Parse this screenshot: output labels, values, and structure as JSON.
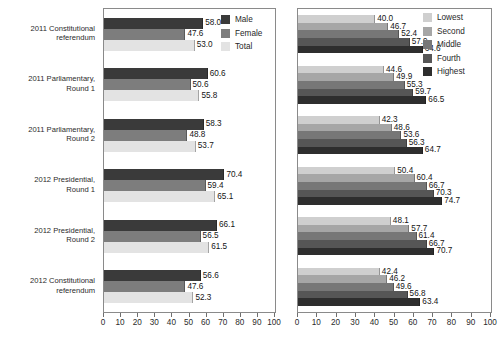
{
  "chart_data": [
    {
      "id": "by-sex",
      "type": "bar",
      "orientation": "horizontal",
      "title": "",
      "xlabel": "",
      "ylabel": "",
      "xlim": [
        0,
        100
      ],
      "xticks": [
        0,
        10,
        20,
        30,
        40,
        50,
        60,
        70,
        80,
        90,
        100
      ],
      "grid": false,
      "legend_position": "top-right",
      "categories": [
        "2011 Constitutional\nreferendum",
        "2011 Parliamentary,\nRound 1",
        "2011 Parliamentary,\nRound 2",
        "2012 Presidential,\nRound 1",
        "2012 Presidential,\nRound 2",
        "2012 Constitutional\nreferendum"
      ],
      "series": [
        {
          "name": "Male",
          "color": "#3a3a3a",
          "values": [
            58.0,
            60.6,
            58.3,
            70.4,
            66.1,
            56.6
          ]
        },
        {
          "name": "Female",
          "color": "#7d7d7d",
          "values": [
            47.6,
            50.6,
            48.8,
            59.4,
            56.5,
            47.6
          ]
        },
        {
          "name": "Total",
          "color": "#e3e3e3",
          "values": [
            53.0,
            55.8,
            53.7,
            65.1,
            61.5,
            52.3
          ]
        }
      ]
    },
    {
      "id": "by-wealth-quintile",
      "type": "bar",
      "orientation": "horizontal",
      "title": "",
      "xlabel": "",
      "ylabel": "",
      "xlim": [
        0,
        100
      ],
      "xticks": [
        0,
        10,
        20,
        30,
        40,
        50,
        60,
        70,
        80,
        90,
        100
      ],
      "grid": false,
      "legend_position": "top-right",
      "categories": [
        "2011 Constitutional referendum",
        "2011 Parliamentary, Round 1",
        "2011 Parliamentary, Round 2",
        "2012 Presidential, Round 1",
        "2012 Presidential, Round 2",
        "2012 Constitutional referendum"
      ],
      "series": [
        {
          "name": "Lowest",
          "color": "#cfcfcf",
          "values": [
            40.0,
            44.6,
            42.3,
            50.4,
            48.1,
            42.4
          ]
        },
        {
          "name": "Second",
          "color": "#a6a6a6",
          "values": [
            46.7,
            49.9,
            48.6,
            60.4,
            57.7,
            46.2
          ]
        },
        {
          "name": "Middle",
          "color": "#777777",
          "values": [
            52.4,
            55.3,
            53.6,
            66.7,
            61.4,
            49.6
          ]
        },
        {
          "name": "Fourth",
          "color": "#565656",
          "values": [
            57.9,
            59.7,
            56.3,
            70.3,
            66.7,
            56.8
          ]
        },
        {
          "name": "Highest",
          "color": "#2e2e2e",
          "values": [
            64.6,
            66.5,
            64.7,
            74.7,
            70.7,
            63.4
          ]
        }
      ]
    }
  ]
}
